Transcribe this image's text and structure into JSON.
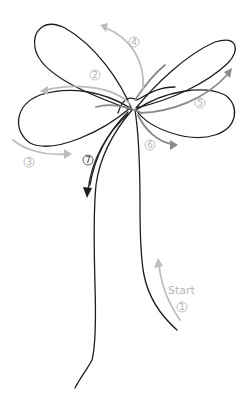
{
  "diagram": {
    "type": "knot-tying-instructions",
    "start_label": "Start",
    "steps": [
      {
        "number": "1",
        "x": 182,
        "y": 307,
        "style": "light"
      },
      {
        "number": "2",
        "x": 95,
        "y": 75,
        "style": "light"
      },
      {
        "number": "3",
        "x": 29,
        "y": 162,
        "style": "light"
      },
      {
        "number": "4",
        "x": 134,
        "y": 42,
        "style": "light"
      },
      {
        "number": "5",
        "x": 200,
        "y": 103,
        "style": "light"
      },
      {
        "number": "6",
        "x": 150,
        "y": 145,
        "style": "light"
      },
      {
        "number": "7",
        "x": 88,
        "y": 160,
        "style": "dark"
      }
    ],
    "colors": {
      "cord": "#1e1e1e",
      "arrow_light": "#bdbdbd",
      "arrow_mid": "#8a8a8a",
      "label": "#b0b0b0"
    }
  }
}
